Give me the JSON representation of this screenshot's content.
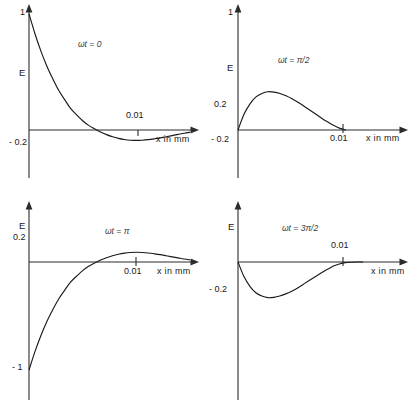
{
  "figure": {
    "title": "",
    "background": "#ffffff",
    "stroke_color": "#1a1a1a",
    "axis_color": "#2b2b2b"
  },
  "chart_data": [
    {
      "id": "panel-1",
      "type": "line",
      "title": "",
      "annotation": "ωt = 0",
      "annotation_symbol": "ωt",
      "annotation_value": "0",
      "xlabel": "x in mm",
      "ylabel": "E",
      "xticks": [
        0.01
      ],
      "xticklabels": [
        "0.01"
      ],
      "yticks": [
        1,
        -0.2
      ],
      "yticklabels": [
        "1",
        "- 0.2"
      ],
      "xlim": [
        0,
        0.0165
      ],
      "ylim": [
        -0.45,
        1.12
      ],
      "grid": false,
      "legend": "none",
      "x": [
        0.0,
        0.0006,
        0.0012,
        0.0018,
        0.0024,
        0.003,
        0.0036,
        0.0042,
        0.0048,
        0.0054,
        0.006,
        0.0066,
        0.0072,
        0.0078,
        0.0084,
        0.009,
        0.0096,
        0.0102,
        0.0108,
        0.0114,
        0.012,
        0.0126,
        0.0132,
        0.0138,
        0.0144,
        0.015,
        0.0156,
        0.0162
      ],
      "y": [
        1.0,
        0.83,
        0.68,
        0.55,
        0.44,
        0.34,
        0.26,
        0.185,
        0.13,
        0.08,
        0.04,
        0.01,
        -0.018,
        -0.04,
        -0.058,
        -0.072,
        -0.082,
        -0.088,
        -0.09,
        -0.088,
        -0.083,
        -0.076,
        -0.068,
        -0.058,
        -0.048,
        -0.038,
        -0.028,
        -0.02
      ]
    },
    {
      "id": "panel-2",
      "type": "line",
      "title": "",
      "annotation": "ωt = π/2",
      "annotation_symbol": "ωt",
      "annotation_value": "π/2",
      "xlabel": "x in mm",
      "ylabel": "E",
      "xticks": [
        0.01
      ],
      "xticklabels": [
        "0.01"
      ],
      "yticks": [
        1,
        0.2,
        -0.2
      ],
      "yticklabels": [
        "1",
        "0.2",
        "- 0.2"
      ],
      "xlim": [
        0,
        0.0165
      ],
      "ylim": [
        -0.45,
        1.12
      ],
      "grid": false,
      "legend": "none",
      "x": [
        0.0,
        0.0006,
        0.0012,
        0.0018,
        0.0024,
        0.003,
        0.0036,
        0.0042,
        0.0048,
        0.0054,
        0.006,
        0.0066,
        0.0072,
        0.0078,
        0.0084,
        0.009,
        0.0096,
        0.0102,
        0.0108
      ],
      "y": [
        0.0,
        0.135,
        0.225,
        0.285,
        0.315,
        0.33,
        0.327,
        0.315,
        0.295,
        0.27,
        0.24,
        0.205,
        0.17,
        0.135,
        0.1,
        0.068,
        0.038,
        0.014,
        0.0
      ]
    },
    {
      "id": "panel-3",
      "type": "line",
      "title": "",
      "annotation": "ωt = π",
      "annotation_symbol": "ωt",
      "annotation_value": "π",
      "xlabel": "x in mm",
      "ylabel": "E",
      "xticks": [
        0.01
      ],
      "xticklabels": [
        "0.01"
      ],
      "yticks": [
        0.2,
        -1
      ],
      "yticklabels": [
        "0.2",
        "- 1"
      ],
      "xlim": [
        0,
        0.0165
      ],
      "ylim": [
        -1.12,
        0.42
      ],
      "grid": false,
      "legend": "none",
      "x": [
        0.0,
        0.0006,
        0.0012,
        0.0018,
        0.0024,
        0.003,
        0.0036,
        0.0042,
        0.0048,
        0.0054,
        0.006,
        0.0066,
        0.0072,
        0.0078,
        0.0084,
        0.009,
        0.0096,
        0.0102,
        0.0108,
        0.0114,
        0.012,
        0.0126,
        0.0132,
        0.0138,
        0.0144,
        0.015,
        0.0156,
        0.0162
      ],
      "y": [
        -1.0,
        -0.83,
        -0.68,
        -0.55,
        -0.44,
        -0.34,
        -0.26,
        -0.185,
        -0.13,
        -0.08,
        -0.04,
        -0.01,
        0.018,
        0.04,
        0.058,
        0.072,
        0.082,
        0.088,
        0.09,
        0.088,
        0.083,
        0.076,
        0.068,
        0.058,
        0.048,
        0.038,
        0.028,
        0.02
      ]
    },
    {
      "id": "panel-4",
      "type": "line",
      "title": "",
      "annotation": "ωt = 3π/2",
      "annotation_symbol": "ωt",
      "annotation_value": "3π/2",
      "xlabel": "x in mm",
      "ylabel": "E",
      "xticks": [
        0.01
      ],
      "xticklabels": [
        "0.01"
      ],
      "yticks": [
        -0.2
      ],
      "yticklabels": [
        "- 0.2"
      ],
      "xlim": [
        0,
        0.0165
      ],
      "ylim": [
        -1.12,
        0.42
      ],
      "grid": false,
      "legend": "none",
      "x": [
        0.0,
        0.0006,
        0.0012,
        0.0018,
        0.0024,
        0.003,
        0.0036,
        0.0042,
        0.0048,
        0.0054,
        0.006,
        0.0066,
        0.0072,
        0.0078,
        0.0084,
        0.009,
        0.0096,
        0.0102,
        0.0108,
        0.0114,
        0.012,
        0.0126
      ],
      "y": [
        0.0,
        -0.135,
        -0.225,
        -0.285,
        -0.315,
        -0.33,
        -0.327,
        -0.315,
        -0.295,
        -0.27,
        -0.24,
        -0.205,
        -0.17,
        -0.135,
        -0.1,
        -0.068,
        -0.038,
        -0.018,
        -0.006,
        -0.002,
        0.0,
        0.0
      ]
    }
  ]
}
